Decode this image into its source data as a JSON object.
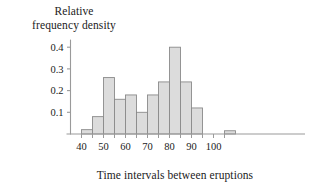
{
  "figure": {
    "ylabel_lines": [
      "Relative",
      "frequency density"
    ],
    "xlabel": "Time intervals between eruptions"
  },
  "axes": {
    "y_ticks": [
      "0.1",
      "0.2",
      "0.3",
      "0.4"
    ],
    "x_ticks": [
      "40",
      "50",
      "60",
      "70",
      "80",
      "90",
      "100"
    ]
  },
  "colors": {
    "bar_fill": "#dcdcdc",
    "bar_stroke": "#8a8a8a",
    "axis": "#9a9a9a",
    "text": "#1b1b1b"
  },
  "chart_data": {
    "type": "bar",
    "title": "",
    "subtitle": "",
    "xlabel": "Time intervals between eruptions",
    "ylabel": "Relative frequency density",
    "xlim": [
      35,
      112
    ],
    "ylim": [
      0,
      0.44
    ],
    "grid": false,
    "legend": null,
    "x_tick_values": [
      40,
      50,
      60,
      70,
      80,
      90,
      100
    ],
    "x_minor_tick_values": [
      40,
      45,
      50,
      55,
      60,
      65,
      70,
      75,
      80,
      85,
      90,
      95,
      100,
      105
    ],
    "y_tick_values": [
      0.1,
      0.2,
      0.3,
      0.4
    ],
    "bin_width": 5,
    "categories": [
      "40-45",
      "45-50",
      "50-55",
      "55-60",
      "60-65",
      "65-70",
      "70-75",
      "75-80",
      "80-85",
      "85-90",
      "90-95",
      "105-110"
    ],
    "bins": [
      {
        "start": 40,
        "end": 45,
        "value": 0.02
      },
      {
        "start": 45,
        "end": 50,
        "value": 0.08
      },
      {
        "start": 50,
        "end": 55,
        "value": 0.26
      },
      {
        "start": 55,
        "end": 60,
        "value": 0.16
      },
      {
        "start": 60,
        "end": 65,
        "value": 0.18
      },
      {
        "start": 65,
        "end": 70,
        "value": 0.1
      },
      {
        "start": 70,
        "end": 75,
        "value": 0.18
      },
      {
        "start": 75,
        "end": 80,
        "value": 0.24
      },
      {
        "start": 80,
        "end": 85,
        "value": 0.4
      },
      {
        "start": 85,
        "end": 90,
        "value": 0.24
      },
      {
        "start": 90,
        "end": 95,
        "value": 0.12
      },
      {
        "start": 105,
        "end": 110,
        "value": 0.015
      }
    ],
    "values": [
      0.02,
      0.08,
      0.26,
      0.16,
      0.18,
      0.1,
      0.18,
      0.24,
      0.4,
      0.24,
      0.12,
      0.015
    ]
  }
}
